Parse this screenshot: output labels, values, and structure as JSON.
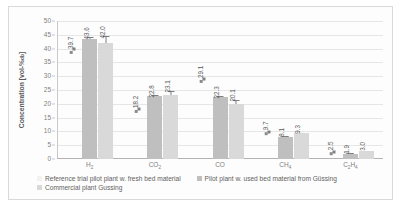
{
  "chart_data": {
    "type": "bar",
    "title": "",
    "xlabel": "",
    "ylabel": "Concentration [vol-%db]",
    "ylabel_main": "Concentration [vol-%",
    "ylabel_sub": "db",
    "ylabel_tail": "]",
    "ylim": [
      0,
      50
    ],
    "ytick_step": 5,
    "yticks": [
      "0",
      "5",
      "10",
      "15",
      "20",
      "25",
      "30",
      "35",
      "40",
      "45",
      "50"
    ],
    "grid": true,
    "legend_position": "bottom",
    "categories": [
      "H2",
      "CO2",
      "CO",
      "CH4",
      "C2H4"
    ],
    "category_labels": [
      {
        "main": "H",
        "sub": "2",
        "tail": ""
      },
      {
        "main": "CO",
        "sub": "2",
        "tail": ""
      },
      {
        "main": "CO",
        "sub": "",
        "tail": ""
      },
      {
        "main": "CH",
        "sub": "4",
        "tail": ""
      },
      {
        "main": "C",
        "sub": "2",
        "tail": "H",
        "sub2": "4"
      }
    ],
    "series": [
      {
        "name": "Reference trial pilot plant w. fresh bed material",
        "style": "marker",
        "color": "#8c8c8c",
        "values": [
          39.7,
          18.2,
          29.1,
          9.7,
          2.5
        ],
        "labels": [
          "39.7",
          "18.2",
          "29.1",
          "9.7",
          "2.5"
        ],
        "errors": [
          0,
          0,
          0,
          0,
          0
        ]
      },
      {
        "name": "Pilot plant w. used bed material from Güssing",
        "style": "bar",
        "color": "#bfbfbf",
        "values": [
          43.6,
          22.8,
          22.3,
          8.1,
          1.9
        ],
        "labels": [
          "43.6",
          "22.8",
          "22.3",
          "8.1",
          "1.9"
        ],
        "errors": [
          0.6,
          0.3,
          0.4,
          0.3,
          0.2
        ]
      },
      {
        "name": "Commercial plant Gussing",
        "style": "bar",
        "color": "#d9d9d9",
        "values": [
          42.0,
          23.1,
          20.1,
          9.3,
          3.0
        ],
        "labels": [
          "42.0",
          "23.1",
          "20.1",
          "9.3",
          "3.0"
        ],
        "errors": [
          2.5,
          1.7,
          1.4,
          0.0,
          0.0
        ]
      }
    ]
  },
  "legend": {
    "entries": [
      "Reference trial pilot plant w. fresh bed material",
      "Pilot plant w. used bed material from Güssing",
      "Commercial plant Gussing"
    ]
  }
}
